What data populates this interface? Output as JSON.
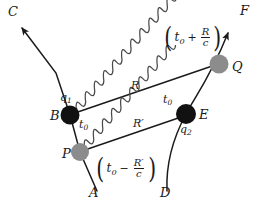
{
  "diagram": {
    "background_color": "#ffffff",
    "line_color": "#1a1a1a",
    "wave_color": "#4a4a4a",
    "node_black": "#111111",
    "node_gray": "#8c8c8c"
  },
  "worldlines": [
    {
      "id": "left-worldline",
      "from_label": "A",
      "to_label": "C",
      "arrow_at": "C"
    },
    {
      "id": "right-worldline",
      "from_label": "D",
      "to_label": "F",
      "arrow_at": "F"
    }
  ],
  "endpoints": {
    "c": "C",
    "f": "F",
    "a": "A",
    "d": "D"
  },
  "nodes": [
    {
      "id": "B",
      "label": "B",
      "fill": "black",
      "charge": "q",
      "charge_sub": "1"
    },
    {
      "id": "P",
      "label": "P",
      "fill": "gray",
      "charge": "",
      "charge_sub": ""
    },
    {
      "id": "E",
      "label": "E",
      "fill": "black",
      "charge": "q",
      "charge_sub": "2"
    },
    {
      "id": "Q",
      "label": "Q",
      "fill": "gray",
      "charge": "",
      "charge_sub": ""
    }
  ],
  "charges": {
    "q1": {
      "base": "q",
      "sub": "1"
    },
    "q2": {
      "base": "q",
      "sub": "2"
    }
  },
  "waves": [
    {
      "id": "upper-wave",
      "from": "B",
      "to": "Q",
      "label": "R",
      "label_prime": false
    },
    {
      "id": "lower-wave",
      "from": "P",
      "to": "E",
      "label": "R",
      "label_prime": true
    }
  ],
  "wave_labels": {
    "upper": "R",
    "lower": "R′"
  },
  "time_labels": [
    {
      "id": "t0-at-B",
      "base": "t",
      "sub": "0"
    },
    {
      "id": "t0-below-B",
      "base": "t",
      "sub": "0"
    },
    {
      "id": "t0-near-E",
      "base": "t",
      "sub": "0"
    }
  ],
  "time_symbol": {
    "base": "t",
    "sub": "0"
  },
  "formulas": [
    {
      "id": "advanced-time",
      "position": "top-right",
      "open": "(",
      "term": "t",
      "term_sub": "0",
      "operator": "+",
      "numerator": "R",
      "denominator": "c",
      "close": ")",
      "plain": "(t₀ + R/c)"
    },
    {
      "id": "retarded-time",
      "position": "bottom-center",
      "open": "(",
      "term": "t",
      "term_sub": "0",
      "operator": "−",
      "numerator": "R′",
      "denominator": "c",
      "close": ")",
      "plain": "(t₀ − R′/c)"
    }
  ]
}
